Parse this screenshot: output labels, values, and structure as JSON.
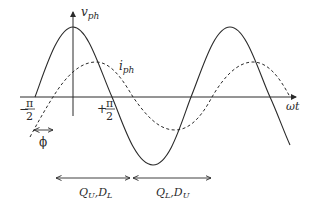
{
  "diagram": {
    "title": "",
    "axes": {
      "y_label": "v",
      "y_label_sub": "ph",
      "x_label": "ωt"
    },
    "curves": [
      {
        "name": "v_ph",
        "style": "solid",
        "label": "",
        "description": "phase voltage sine wave"
      },
      {
        "name": "i_ph",
        "style": "dashed",
        "label": "i",
        "label_sub": "ph",
        "description": "phase current sine wave lagging by phi"
      }
    ],
    "tick_labels": {
      "minus_half_pi_sign": "−",
      "minus_half_pi_num": "π",
      "minus_half_pi_den": "2",
      "plus_half_pi_sign": "+",
      "plus_half_pi_num": "π",
      "plus_half_pi_den": "2"
    },
    "phase_shift_label": "ϕ",
    "intervals": [
      {
        "label_a": "Q",
        "label_a_sub": "U",
        "sep": ",",
        "label_b": "D",
        "label_b_sub": "L"
      },
      {
        "label_a": "Q",
        "label_a_sub": "L",
        "sep": ",",
        "label_b": "D",
        "label_b_sub": "U"
      }
    ],
    "colors": {
      "line": "#2a2a2a",
      "background": "#ffffff"
    }
  }
}
